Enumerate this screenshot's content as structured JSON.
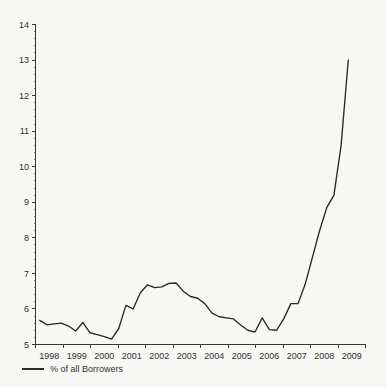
{
  "chart_data": {
    "type": "line",
    "title": "",
    "subtitle": "",
    "xlabel": "",
    "ylabel": "",
    "xlim": [
      1997.75,
      2009.25
    ],
    "ylim": [
      5,
      14
    ],
    "grid": false,
    "legend_position": "bottom-left",
    "y_ticks": [
      "5",
      "6",
      "7",
      "8",
      "9",
      "10",
      "11",
      "12",
      "13",
      "14"
    ],
    "y_tick_values": [
      5,
      6,
      7,
      8,
      9,
      10,
      11,
      12,
      13,
      14
    ],
    "y_minor_ticks_per_interval": 4,
    "x_ticks": [
      "1998",
      "1999",
      "2000",
      "2001",
      "2002",
      "2003",
      "2004",
      "2005",
      "2006",
      "2007",
      "2008",
      "2009"
    ],
    "x_tick_values": [
      1998,
      1999,
      2000,
      2001,
      2002,
      2003,
      2004,
      2005,
      2006,
      2007,
      2008,
      2009
    ],
    "series": [
      {
        "name": "% of all Borrowers",
        "color": "#2b2926",
        "x": [
          1997.9,
          1998.15,
          1998.4,
          1998.65,
          1998.9,
          1999.15,
          1999.4,
          1999.65,
          1999.9,
          2000.15,
          2000.4,
          2000.65,
          2000.9,
          2001.15,
          2001.4,
          2001.65,
          2001.9,
          2002.15,
          2002.4,
          2002.65,
          2002.9,
          2003.15,
          2003.4,
          2003.65,
          2003.9,
          2004.15,
          2004.4,
          2004.65,
          2004.9,
          2005.15,
          2005.4,
          2005.65,
          2005.9,
          2006.15,
          2006.4,
          2006.65,
          2006.9,
          2007.15,
          2007.4,
          2007.65,
          2007.9,
          2008.15,
          2008.4,
          2008.65
        ],
        "values": [
          5.68,
          5.55,
          5.58,
          5.6,
          5.52,
          5.38,
          5.62,
          5.33,
          5.28,
          5.22,
          5.15,
          5.45,
          6.1,
          6.0,
          6.45,
          6.68,
          6.6,
          6.62,
          6.72,
          6.73,
          6.5,
          6.35,
          6.3,
          6.15,
          5.88,
          5.78,
          5.75,
          5.72,
          5.55,
          5.4,
          5.35,
          5.75,
          5.42,
          5.4,
          5.72,
          6.15,
          6.15,
          6.7,
          7.45,
          8.2,
          8.85,
          9.2,
          10.6,
          13.0
        ]
      }
    ]
  },
  "legend": {
    "entries": [
      {
        "label": "% of all Borrowers",
        "color": "#2b2926",
        "marker": "line-swatch"
      }
    ]
  },
  "colors": {
    "background": "#f7f7f5",
    "axis": "#3a3735",
    "text": "#33302e",
    "line": "#2b2926"
  }
}
